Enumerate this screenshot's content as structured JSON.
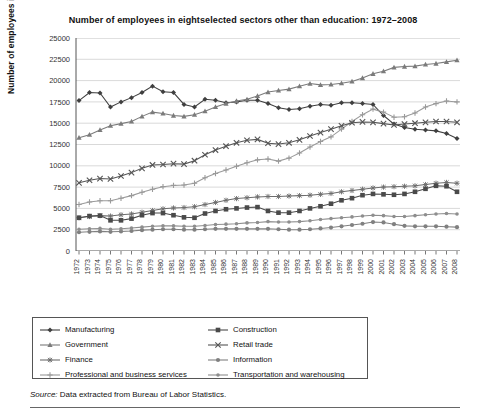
{
  "title": "Number of employees in eightselected sectors other than education: 1972–2008",
  "source_prefix": "Source:",
  "source_text": " Data extracted from Bureau of Labor Statistics.",
  "legend": {
    "items": [
      {
        "label": "Manufacturing",
        "marker": "diamond",
        "color": "#3f3f3f"
      },
      {
        "label": "Construction",
        "marker": "square",
        "color": "#4a4a4a"
      },
      {
        "label": "Government",
        "marker": "triangle",
        "color": "#7b7b7b"
      },
      {
        "label": "Retail trade",
        "marker": "x",
        "color": "#555555"
      },
      {
        "label": "Finance",
        "marker": "asterisk",
        "color": "#6d6d6d"
      },
      {
        "label": "Information",
        "marker": "circle",
        "color": "#808080"
      },
      {
        "label": "Professional and business services",
        "marker": "plus",
        "color": "#9a9a9a"
      },
      {
        "label": "Transportation and warehousing",
        "marker": "dash",
        "color": "#8e8e8e"
      }
    ]
  },
  "chart_data": {
    "type": "line",
    "title": "Number of employees in eightselected sectors other than education: 1972–2008",
    "xlabel": "",
    "ylabel": "Number of employees in thousands",
    "ylim": [
      0,
      25000
    ],
    "yticks": [
      0,
      2500,
      5000,
      7500,
      10000,
      12500,
      15000,
      17500,
      20000,
      22500,
      25000
    ],
    "grid": "horizontal",
    "legend_position": "bottom",
    "x": [
      1972,
      1973,
      1974,
      1975,
      1976,
      1977,
      1978,
      1979,
      1980,
      1981,
      1982,
      1983,
      1984,
      1985,
      1986,
      1987,
      1988,
      1989,
      1990,
      1991,
      1992,
      1993,
      1994,
      1995,
      1996,
      1997,
      1998,
      1999,
      2000,
      2001,
      2002,
      2003,
      2004,
      2005,
      2006,
      2007,
      2008
    ],
    "series": [
      {
        "name": "Manufacturing",
        "marker": "diamond",
        "color": "#3f3f3f",
        "values": [
          17650,
          18600,
          18550,
          16900,
          17500,
          18000,
          18600,
          19350,
          18700,
          18600,
          17200,
          16900,
          17800,
          17700,
          17400,
          17500,
          17700,
          17700,
          17300,
          16800,
          16600,
          16700,
          17000,
          17200,
          17100,
          17400,
          17400,
          17300,
          17200,
          15900,
          14900,
          14500,
          14300,
          14200,
          14100,
          13800,
          13200
        ]
      },
      {
        "name": "Government",
        "marker": "triangle",
        "color": "#7b7b7b",
        "values": [
          13300,
          13650,
          14200,
          14700,
          14950,
          15200,
          15800,
          16300,
          16150,
          15900,
          15800,
          16000,
          16400,
          16900,
          17300,
          17600,
          17800,
          18200,
          18650,
          18850,
          19000,
          19350,
          19650,
          19500,
          19550,
          19700,
          19900,
          20300,
          20800,
          21100,
          21550,
          21650,
          21700,
          21900,
          22000,
          22200,
          22400
        ]
      },
      {
        "name": "Finance",
        "marker": "asterisk",
        "color": "#6d6d6d",
        "values": [
          3900,
          4050,
          4150,
          4100,
          4250,
          4350,
          4550,
          4750,
          4950,
          5050,
          5100,
          5200,
          5450,
          5700,
          5950,
          6150,
          6250,
          6350,
          6400,
          6400,
          6450,
          6500,
          6550,
          6650,
          6750,
          6950,
          7100,
          7250,
          7400,
          7500,
          7550,
          7600,
          7650,
          7800,
          7950,
          8050,
          7950
        ]
      },
      {
        "name": "Professional and business services",
        "marker": "plus",
        "color": "#9a9a9a",
        "values": [
          5450,
          5750,
          5900,
          5900,
          6200,
          6500,
          6900,
          7250,
          7550,
          7700,
          7750,
          7950,
          8600,
          9100,
          9500,
          9950,
          10350,
          10700,
          10800,
          10550,
          10900,
          11500,
          12200,
          12850,
          13400,
          14300,
          15200,
          16000,
          16650,
          16300,
          15700,
          15750,
          16200,
          16900,
          17300,
          17600,
          17500
        ]
      },
      {
        "name": "Construction",
        "marker": "square",
        "color": "#4a4a4a",
        "values": [
          3900,
          4100,
          4150,
          3600,
          3600,
          3800,
          4200,
          4450,
          4450,
          4200,
          3950,
          3900,
          4400,
          4700,
          4900,
          5000,
          5100,
          5150,
          4700,
          4500,
          4500,
          4700,
          5000,
          5250,
          5550,
          5950,
          6200,
          6550,
          6700,
          6650,
          6600,
          6700,
          6950,
          7300,
          7650,
          7600,
          6950
        ]
      },
      {
        "name": "Retail trade",
        "marker": "x",
        "color": "#555555",
        "values": [
          8000,
          8300,
          8500,
          8450,
          8800,
          9200,
          9700,
          10100,
          10150,
          10250,
          10200,
          10600,
          11300,
          11850,
          12300,
          12700,
          13000,
          13100,
          12650,
          12550,
          12700,
          13050,
          13500,
          13900,
          14300,
          14700,
          15050,
          15150,
          15100,
          14950,
          14800,
          14900,
          15000,
          15100,
          15200,
          15200,
          15100
        ]
      },
      {
        "name": "Information",
        "marker": "circle",
        "color": "#808080",
        "values": [
          2200,
          2250,
          2300,
          2250,
          2300,
          2350,
          2450,
          2500,
          2550,
          2550,
          2500,
          2500,
          2550,
          2600,
          2600,
          2600,
          2600,
          2600,
          2600,
          2550,
          2500,
          2500,
          2550,
          2650,
          2750,
          2900,
          3050,
          3200,
          3400,
          3350,
          3150,
          2950,
          2900,
          2900,
          2900,
          2850,
          2800
        ]
      },
      {
        "name": "Transportation and warehousing",
        "marker": "dash",
        "color": "#8e8e8e",
        "values": [
          2550,
          2600,
          2650,
          2550,
          2600,
          2700,
          2800,
          2900,
          2950,
          2950,
          2900,
          2900,
          3000,
          3100,
          3150,
          3200,
          3300,
          3350,
          3450,
          3400,
          3400,
          3450,
          3550,
          3700,
          3800,
          3900,
          4000,
          4100,
          4200,
          4150,
          4050,
          4050,
          4150,
          4250,
          4350,
          4400,
          4350
        ]
      }
    ]
  }
}
